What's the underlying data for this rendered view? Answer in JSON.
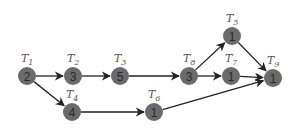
{
  "diagram": {
    "type": "task-precedence-graph",
    "nodes": [
      {
        "id": "T1",
        "label": "T",
        "sub": "1",
        "weight": "2",
        "x": 27,
        "y": 76
      },
      {
        "id": "T2",
        "label": "T",
        "sub": "2",
        "weight": "3",
        "x": 73,
        "y": 76
      },
      {
        "id": "T3",
        "label": "T",
        "sub": "3",
        "weight": "5",
        "x": 120,
        "y": 76
      },
      {
        "id": "T4",
        "label": "T",
        "sub": "4",
        "weight": "4",
        "x": 72,
        "y": 112
      },
      {
        "id": "T5",
        "label": "T",
        "sub": "5",
        "weight": "1",
        "x": 232,
        "y": 36
      },
      {
        "id": "T6",
        "label": "T",
        "sub": "6",
        "weight": "1",
        "x": 154,
        "y": 112
      },
      {
        "id": "T7",
        "label": "T",
        "sub": "7",
        "weight": "1",
        "x": 231,
        "y": 76
      },
      {
        "id": "T8",
        "label": "T",
        "sub": "8",
        "weight": "3",
        "x": 189,
        "y": 76
      },
      {
        "id": "T9",
        "label": "T",
        "sub": "9",
        "weight": "1",
        "x": 273,
        "y": 78
      }
    ],
    "edges": [
      {
        "from": "T1",
        "to": "T2"
      },
      {
        "from": "T1",
        "to": "T4"
      },
      {
        "from": "T2",
        "to": "T3"
      },
      {
        "from": "T3",
        "to": "T8"
      },
      {
        "from": "T4",
        "to": "T6"
      },
      {
        "from": "T8",
        "to": "T5"
      },
      {
        "from": "T8",
        "to": "T7"
      },
      {
        "from": "T5",
        "to": "T9"
      },
      {
        "from": "T7",
        "to": "T9"
      },
      {
        "from": "T6",
        "to": "T9"
      }
    ],
    "colors": {
      "node": "#6b6b6b",
      "edge": "#222222",
      "text": "#2a2a2a"
    }
  }
}
